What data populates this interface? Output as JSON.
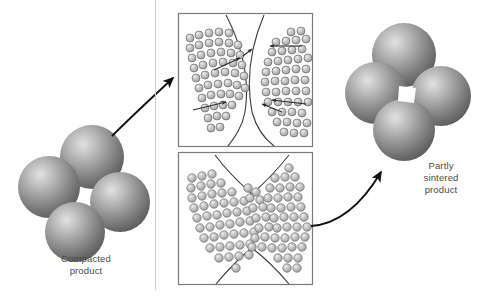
{
  "figure": {
    "background_color": "#ffffff",
    "width": 489,
    "height": 301
  },
  "labels": {
    "compacted": "Compacted\nproduct",
    "sintered": "Partly\nsintered\nproduct"
  },
  "colors": {
    "sphere_dark": "#5d5d5d",
    "sphere_mid": "#8a8a8a",
    "sphere_light": "#d8d8d8",
    "sphere_edge": "#4a4a4a",
    "atom_fill": "#b9b9b9",
    "atom_light": "#e4e4e4",
    "atom_edge": "#6a6a6a",
    "box_border": "#7a7a7a",
    "arrow": "#111111",
    "caption_text": "#4a4a4a",
    "page_rule": "#c9c9c9"
  },
  "clusters": {
    "compacted": {
      "name": "compacted-particle-cluster",
      "description": "Four discrete spherical powder particles touching at points, no necks",
      "particle_count": 4,
      "particles": [
        {
          "cx": 49,
          "cy": 187,
          "r": 31
        },
        {
          "cx": 92,
          "cy": 157,
          "r": 32
        },
        {
          "cx": 120,
          "cy": 202,
          "r": 30
        },
        {
          "cx": 75,
          "cy": 232,
          "r": 30
        }
      ]
    },
    "sintered": {
      "name": "sintered-particle-cluster",
      "description": "Four spherical particles fused with necks, enclosing a central square pore",
      "particle_count": 4,
      "pore_visible": true,
      "particles": [
        {
          "cx": 376,
          "cy": 93,
          "r": 31
        },
        {
          "cx": 404,
          "cy": 55,
          "r": 32
        },
        {
          "cx": 441,
          "cy": 96,
          "r": 30
        },
        {
          "cx": 404,
          "cy": 130,
          "r": 31
        }
      ],
      "pore": {
        "cx": 407,
        "cy": 94,
        "size": 16
      }
    }
  },
  "insets": [
    {
      "name": "inset-initial-contact",
      "description": "Magnified view of two particle surfaces in contact; atoms diffuse across the contact boundary",
      "box": {
        "x": 178,
        "y": 13,
        "w": 135,
        "h": 134
      },
      "atom_rows": 9,
      "diffusion_arrows": 6
    },
    {
      "name": "inset-neck-growth",
      "description": "Magnified view after neck growth; atoms have filled the region between the two particles",
      "box": {
        "x": 178,
        "y": 152,
        "w": 135,
        "h": 133
      },
      "atom_rows": 10,
      "diffusion_arrows": 0
    }
  ],
  "arrows": [
    {
      "name": "arrow-compacted-to-inset",
      "from": "compacted-particle-cluster",
      "to": "inset-initial-contact",
      "style": "curved",
      "direction": "up-right"
    },
    {
      "name": "arrow-inset-to-sintered",
      "from": "inset-neck-growth",
      "to": "sintered-particle-cluster",
      "style": "curved",
      "direction": "up-right"
    }
  ]
}
